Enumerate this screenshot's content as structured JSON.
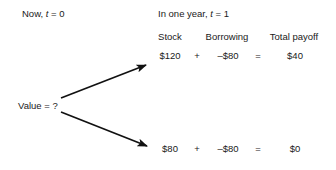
{
  "figure": {
    "background_color": "#ffffff",
    "text_color": "#1a1a1a",
    "arrow_color": "#111111"
  },
  "headers": {
    "now": {
      "prefix": "Now, ",
      "variable": "t",
      "suffix": " = 0"
    },
    "future": {
      "prefix": "In one year, ",
      "variable": "t",
      "suffix": " = 1"
    }
  },
  "columns": [
    {
      "key": "stock",
      "label": "Stock"
    },
    {
      "key": "borrowing",
      "label": "Borrowing"
    },
    {
      "key": "total",
      "label": "Total payoff"
    }
  ],
  "operators": {
    "plus": "+",
    "equals": "="
  },
  "nodes": {
    "root": {
      "label": "Value = ?",
      "value": "?"
    }
  },
  "branches": [
    {
      "name": "up-branch",
      "stock": "$120",
      "borrowing": "–$80",
      "total": "$40"
    },
    {
      "name": "down-branch",
      "stock": "$80",
      "borrowing": "–$80",
      "total": "$0"
    }
  ],
  "arrows": [
    {
      "name": "up-arrow",
      "from_x": 61,
      "from_y": 98,
      "to_x": 149,
      "to_y": 63
    },
    {
      "name": "down-arrow",
      "from_x": 61,
      "from_y": 112,
      "to_x": 151,
      "to_y": 148
    }
  ]
}
